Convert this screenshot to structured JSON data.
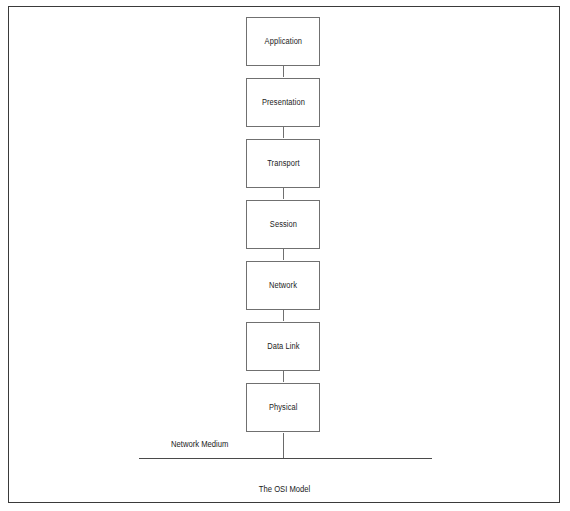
{
  "figure": {
    "caption": "The OSI Model",
    "border_color": "#3a3a3a",
    "background_color": "#ffffff"
  },
  "diagram": {
    "type": "vertical-stack-flow",
    "box_border_color": "#707070",
    "line_color": "#4a4a4a",
    "text_color": "#1b1b1b",
    "layers": [
      {
        "label": "Application",
        "index": 7
      },
      {
        "label": "Presentation",
        "index": 6
      },
      {
        "label": "Transport",
        "index": 4
      },
      {
        "label": "Session",
        "index": 5
      },
      {
        "label": "Network",
        "index": 3
      },
      {
        "label": "Data Link",
        "index": 2
      },
      {
        "label": "Physical",
        "index": 1
      }
    ],
    "medium": {
      "label": "Network Medium"
    }
  }
}
